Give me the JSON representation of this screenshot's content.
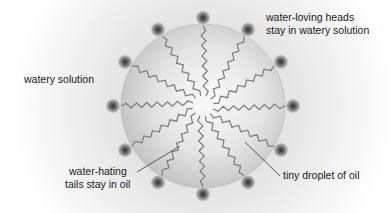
{
  "diagram": {
    "labels": {
      "watery_solution": "watery solution",
      "heads_line1": "water-loving heads",
      "heads_line2": "stay in watery solution",
      "tails_line1": "water-hating",
      "tails_line2": "tails stay in oil",
      "droplet": "tiny droplet of oil"
    },
    "droplet": {
      "cx": 203,
      "cy": 106,
      "r": 82
    },
    "molecule_count": 12,
    "head_radius_from_center": 90,
    "colors": {
      "background": "#ffffff",
      "halo": "#d6d6d6",
      "droplet_light": "#f4f4f4",
      "droplet_dark": "#bdbdbd",
      "tail": "#7a7a7a",
      "head_outer": "#9a9a9a",
      "head_core": "#3c3c3c",
      "text": "#1a1a1a"
    }
  }
}
